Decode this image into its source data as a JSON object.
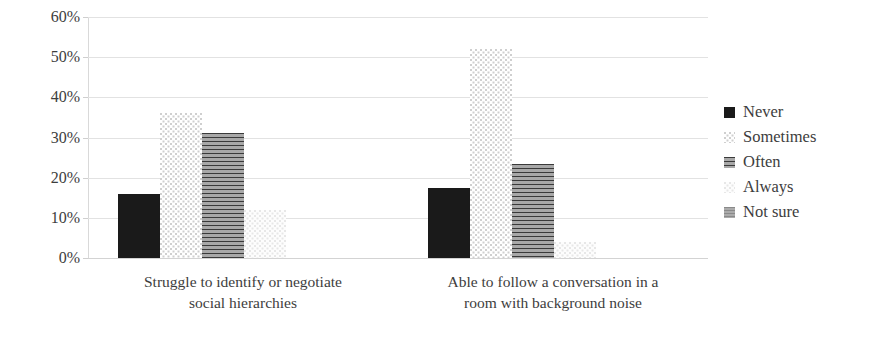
{
  "chart_data": {
    "type": "bar",
    "title": "",
    "subtitle": "",
    "xlabel": "",
    "ylabel": "",
    "ylim": [
      0,
      60
    ],
    "ytick_labels": [
      "60%",
      "50%",
      "40%",
      "30%",
      "20%",
      "10%",
      "0%"
    ],
    "ytick_values": [
      60,
      50,
      40,
      30,
      20,
      10,
      0
    ],
    "ytick_step": 10,
    "grid": true,
    "value_unit": "%",
    "legend_position": "right",
    "categories": [
      "Struggle to identify or negotiate social hierarchies",
      "Able to follow a conversation in a room with background noise"
    ],
    "category_lines": [
      [
        "Struggle to identify or negotiate",
        "social hierarchies"
      ],
      [
        "Able to follow a conversation in a",
        "room with background noise"
      ]
    ],
    "series": [
      {
        "name": "Never",
        "pattern": "solid-black",
        "color": "#1a1a1a",
        "values": [
          16.0,
          17.5
        ]
      },
      {
        "name": "Sometimes",
        "pattern": "light-dotted",
        "color": "#cfcfcf",
        "values": [
          36.0,
          52.0
        ]
      },
      {
        "name": "Often",
        "pattern": "horizontal-stripes",
        "color": "#8d8d8d",
        "values": [
          31.0,
          23.5
        ]
      },
      {
        "name": "Always",
        "pattern": "faint-dotted",
        "color": "#e7e7e7",
        "values": [
          12.0,
          4.0
        ]
      },
      {
        "name": "Not sure",
        "pattern": "medium-gray",
        "color": "#9a9a9a",
        "values": [
          0.0,
          0.0
        ]
      }
    ]
  },
  "legend": {
    "items": [
      {
        "label": "Never"
      },
      {
        "label": "Sometimes"
      },
      {
        "label": "Often"
      },
      {
        "label": "Always"
      },
      {
        "label": "Not sure"
      }
    ]
  }
}
